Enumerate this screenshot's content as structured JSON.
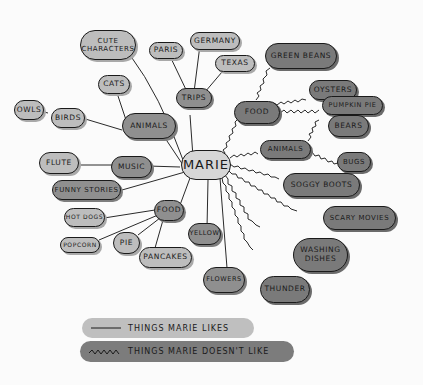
{
  "center": {
    "label": "MARIE"
  },
  "likes": {
    "cute_characters": "CUTE CHARACTERS",
    "paris": "PARIS",
    "germany": "GERMANY",
    "texas": "TEXAS",
    "trips": "TRIPS",
    "cats": "CATS",
    "owls": "OWLS",
    "birds": "BIRDS",
    "animals": "ANIMALS",
    "flute": "FLUTE",
    "music": "MUSIC",
    "funny_stories": "FUNNY STORIES",
    "food": "FOOD",
    "hot_dogs": "HOT DOGS",
    "popcorn": "POPCORN",
    "pie": "PIE",
    "pancakes": "PANCAKES",
    "yellow": "YELLOW",
    "flowers": "FLOWERS"
  },
  "dislikes": {
    "green_beans": "GREEN BEANS",
    "food": "FOOD",
    "oysters": "OYSTERS",
    "pumpkin_pie": "PUMPKIN PIE",
    "bears": "BEARS",
    "animals": "ANIMALS",
    "bugs": "BUGS",
    "soggy_boots": "SOGGY BOOTS",
    "scary_movies": "SCARY MOVIES",
    "washing_dishes": "WASHING DISHES",
    "thunder": "THUNDER"
  },
  "legend": {
    "likes": "THINGS MARIE LIKES",
    "dislikes": "THINGS MARIE DOESN'T LIKE"
  },
  "colors": {
    "like_fill": "#bdbdbd",
    "dislike_fill": "#7a7a7a",
    "stroke": "#1a1a1a",
    "background": "#fbfbfb"
  }
}
